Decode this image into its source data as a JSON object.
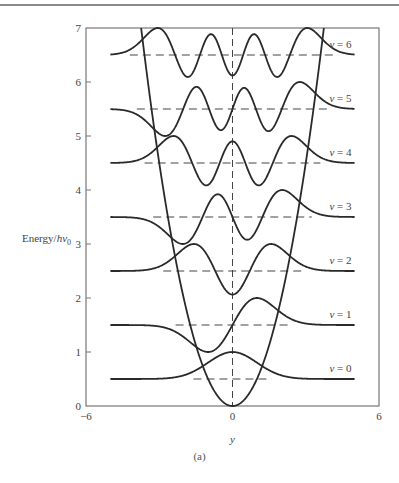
{
  "chart_data": {
    "type": "line",
    "title": "",
    "xlabel": "y",
    "ylabel": "Energy/hν0",
    "ylabel_main": "Energy/",
    "ylabel_h": "hν",
    "ylabel_sub": "0",
    "xlim": [
      -6,
      6
    ],
    "ylim": [
      0,
      7
    ],
    "x_ticks": [
      "-6",
      "0",
      "6"
    ],
    "y_ticks": [
      "0",
      "1",
      "2",
      "3",
      "4",
      "5",
      "6",
      "7"
    ],
    "grid": false,
    "caption": "(a)",
    "potential": {
      "name": "V(y) = y^2/2",
      "formula": "0.5*y^2"
    },
    "wavefunction_range": [
      -5,
      5
    ],
    "wavefunction_amplitude": 0.5,
    "levels": [
      {
        "v": 0,
        "energy": 0.5,
        "label": "v = 0"
      },
      {
        "v": 1,
        "energy": 1.5,
        "label": "v = 1"
      },
      {
        "v": 2,
        "energy": 2.5,
        "label": "v = 2"
      },
      {
        "v": 3,
        "energy": 3.5,
        "label": "v = 3"
      },
      {
        "v": 4,
        "energy": 4.5,
        "label": "v = 4"
      },
      {
        "v": 5,
        "energy": 5.5,
        "label": "v = 5"
      },
      {
        "v": 6,
        "energy": 6.5,
        "label": "v = 6"
      }
    ],
    "colors": {
      "curve": "#2a2a2a",
      "frame": "#777777",
      "dashed": "#444444"
    }
  }
}
